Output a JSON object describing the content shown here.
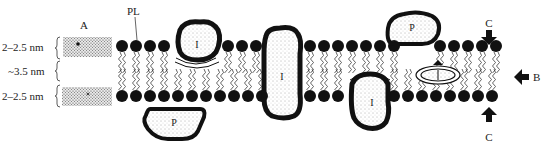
{
  "diagram": {
    "type": "membrane-cross-section",
    "background": "#ffffff",
    "ink": "#111111",
    "labels": {
      "inset": "A",
      "phospholipid": "PL",
      "lateral_arrow": "B",
      "vertical_arrow_top": "C",
      "vertical_arrow_bottom": "C"
    },
    "dimensions": [
      {
        "label": "2–2.5 nm",
        "region": "outer-polar-layer"
      },
      {
        "label": "~3.5 nm",
        "region": "hydrophobic-core"
      },
      {
        "label": "2–2.5 nm",
        "region": "inner-polar-layer"
      }
    ],
    "proteins": [
      {
        "id": "integral-1",
        "label": "I",
        "kind": "integral",
        "position": "partial-top"
      },
      {
        "id": "peripheral-1",
        "label": "P",
        "kind": "peripheral",
        "position": "bottom"
      },
      {
        "id": "integral-2",
        "label": "I",
        "kind": "integral",
        "position": "transmembrane"
      },
      {
        "id": "integral-3",
        "label": "I",
        "kind": "integral",
        "position": "partial-bottom"
      },
      {
        "id": "peripheral-2",
        "label": "P",
        "kind": "peripheral",
        "position": "top"
      },
      {
        "id": "integral-4",
        "label": "I",
        "kind": "integral",
        "position": "embedded-core"
      }
    ]
  }
}
